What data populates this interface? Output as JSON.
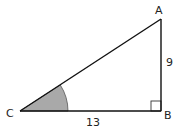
{
  "diagram": {
    "type": "right-triangle",
    "vertices": {
      "A": {
        "label": "A",
        "x": 161,
        "y": 19
      },
      "B": {
        "label": "B",
        "x": 161,
        "y": 111
      },
      "C": {
        "label": "C",
        "x": 20,
        "y": 111
      }
    },
    "sides": {
      "AB": {
        "label": "9"
      },
      "CB": {
        "label": "13"
      }
    },
    "right_angle_at": "B",
    "shaded_angle_at": "C",
    "colors": {
      "stroke": "#111111",
      "angle_fill": "#a9a9a9",
      "background": "#ffffff"
    }
  }
}
